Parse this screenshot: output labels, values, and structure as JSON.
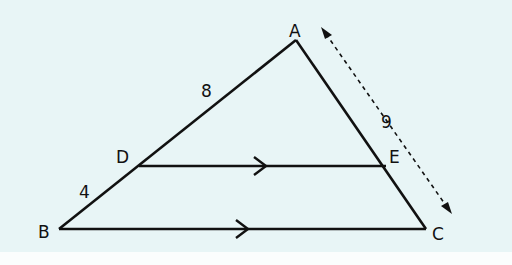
{
  "diagram": {
    "type": "triangle-parallel-line",
    "colors": {
      "background": "#e8f5f6",
      "stroke": "#111111"
    },
    "vertices": {
      "A": {
        "label": "A",
        "x": 296,
        "y": 40
      },
      "B": {
        "label": "B",
        "x": 59,
        "y": 229
      },
      "C": {
        "label": "C",
        "x": 426,
        "y": 229
      },
      "D": {
        "label": "D",
        "x": 139,
        "y": 166
      },
      "E": {
        "label": "E",
        "x": 386,
        "y": 166
      }
    },
    "segment_labels": {
      "AD": "8",
      "DB": "4",
      "AC": "9"
    },
    "parallel": [
      "DE",
      "BC"
    ]
  }
}
